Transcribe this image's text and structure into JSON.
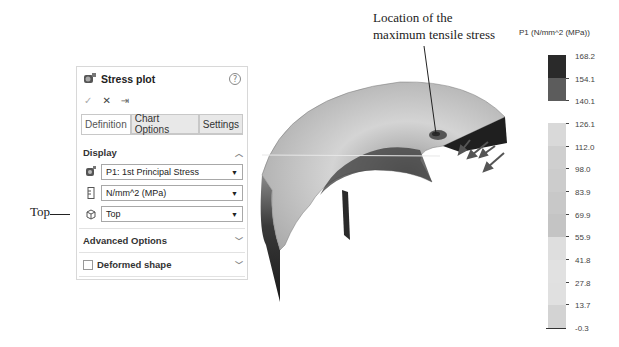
{
  "annotations": {
    "top_label": "Top",
    "location_line1": "Location of the",
    "location_line2": "maximum tensile stress"
  },
  "panel": {
    "title": "Stress plot",
    "icons": {
      "title": "stress-plot-icon",
      "help": "help-icon"
    },
    "help_glyph": "?",
    "actions": {
      "ok": "✓",
      "cancel": "✕",
      "pin": "⇥"
    },
    "tabs": [
      {
        "label": "Definition",
        "active": true
      },
      {
        "label": "Chart Options",
        "active": false
      },
      {
        "label": "Settings",
        "active": false
      }
    ],
    "display": {
      "heading": "Display",
      "component": "P1: 1st Principal Stress",
      "units": "N/mm^2 (MPa)",
      "view": "Top"
    },
    "advanced_options": "Advanced Options",
    "deformed_shape": {
      "label": "Deformed shape",
      "checked": false
    }
  },
  "legend": {
    "title": "P1 (N/mm^2 (MPa))",
    "values": [
      "168.2",
      "154.1",
      "140.1",
      "126.1",
      "112.0",
      "98.0",
      "83.9",
      "69.9",
      "55.9",
      "41.8",
      "27.8",
      "13.7",
      "-0.3"
    ],
    "colors": [
      "#2a2a2a",
      "#5c5c5c",
      "#ffffff",
      "#d9d9d9",
      "#d0d0d0",
      "#cfcfcf",
      "#c9c9c9",
      "#c4c4c4",
      "#dedede",
      "#e1e1e1",
      "#e0e0e0",
      "#d3d3d3"
    ]
  },
  "colors": {
    "panel_border": "#d8d8d8",
    "tab_inactive": "#e8e8e8"
  }
}
